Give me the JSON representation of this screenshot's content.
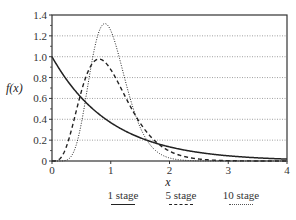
{
  "chart_data": {
    "type": "line",
    "title": "",
    "xlabel": "x",
    "ylabel": "f(x)",
    "xlim": [
      0,
      4
    ],
    "ylim": [
      0,
      1.4
    ],
    "x_ticks": [
      "0",
      "1",
      "2",
      "3",
      "4"
    ],
    "y_ticks": [
      "0",
      "0.2",
      "0.4",
      "0.6",
      "0.8",
      "1.0",
      "1.2",
      "1.4"
    ],
    "grid": "horizontal dotted",
    "legend_position": "bottom",
    "series": [
      {
        "name": "1 stage",
        "style": "solid",
        "x": [
          0,
          0.25,
          0.5,
          0.75,
          1.0,
          1.5,
          2.0,
          2.5,
          3.0,
          3.5,
          4.0
        ],
        "values": [
          1.0,
          0.78,
          0.61,
          0.47,
          0.37,
          0.22,
          0.14,
          0.08,
          0.05,
          0.03,
          0.02
        ]
      },
      {
        "name": "5 stage",
        "style": "dashed",
        "x": [
          0,
          0.25,
          0.5,
          0.75,
          0.8,
          1.0,
          1.25,
          1.5,
          2.0,
          2.5,
          3.0,
          4.0
        ],
        "values": [
          0,
          0.14,
          0.66,
          0.97,
          0.98,
          0.88,
          0.61,
          0.37,
          0.1,
          0.02,
          0.0,
          0.0
        ]
      },
      {
        "name": "10 stage",
        "style": "dotted",
        "x": [
          0,
          0.25,
          0.5,
          0.75,
          0.9,
          1.0,
          1.25,
          1.5,
          2.0,
          2.5,
          3.0,
          4.0
        ],
        "values": [
          0,
          0.01,
          0.36,
          1.14,
          1.32,
          1.25,
          0.77,
          0.34,
          0.04,
          0.0,
          0.0,
          0.0
        ]
      }
    ]
  },
  "legend": {
    "items": [
      {
        "label": "1 stage",
        "style": "solid"
      },
      {
        "label": "5 stage",
        "style": "dashed"
      },
      {
        "label": "10 stage",
        "style": "dotted"
      }
    ]
  },
  "colors": {
    "axis": "#333333",
    "grid": "#888888",
    "line": "#222222"
  }
}
